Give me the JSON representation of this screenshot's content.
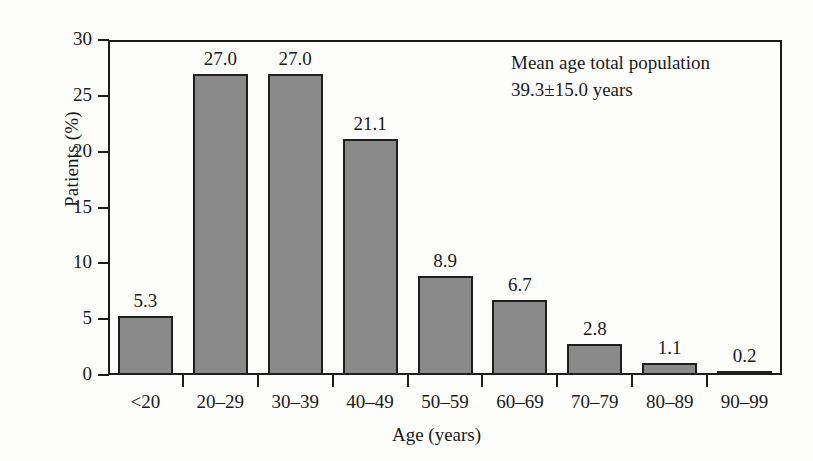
{
  "chart_data": {
    "type": "bar",
    "title": "",
    "xlabel": "Age (years)",
    "ylabel": "Patients (%)",
    "categories": [
      "<20",
      "20–29",
      "30–39",
      "40–49",
      "50–59",
      "60–69",
      "70–79",
      "80–89",
      "90–99"
    ],
    "values": [
      5.3,
      27.0,
      27.0,
      21.1,
      8.9,
      6.7,
      2.8,
      1.1,
      0.2
    ],
    "value_labels": [
      "5.3",
      "27.0",
      "27.0",
      "21.1",
      "8.9",
      "6.7",
      "2.8",
      "1.1",
      "0.2"
    ],
    "ylim": [
      0,
      30
    ],
    "ytick_labels": [
      "0",
      "5",
      "10",
      "15",
      "20",
      "25",
      "30"
    ],
    "ytick_values": [
      0,
      5,
      10,
      15,
      20,
      25,
      30
    ],
    "grid": false,
    "legend": "none",
    "bar_color": "#8a8a8a",
    "bar_edge_color": "#1f1f1f",
    "axis_color": "#1c1c1c",
    "background_color": "#fdfdfc",
    "annotations": [
      "Mean age total population",
      "39.3±15.0 years"
    ]
  }
}
